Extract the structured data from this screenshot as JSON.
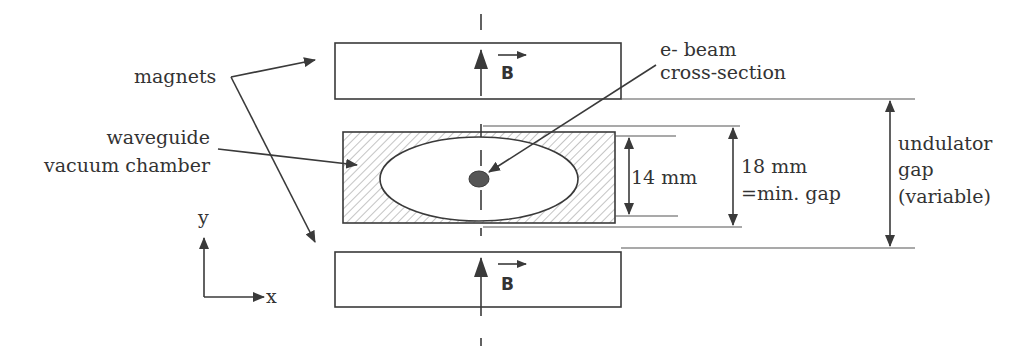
{
  "diagram": {
    "labels": {
      "magnets": "magnets",
      "waveguide_line1": "waveguide",
      "waveguide_line2": "vacuum chamber",
      "ebeam_line1": "e- beam",
      "ebeam_line2": "cross-section",
      "dim_inner": "14 mm",
      "dim_min_line1": "18 mm",
      "dim_min_line2": "=min. gap",
      "undulator_line1": "undulator",
      "undulator_line2": "gap",
      "undulator_line3": "(variable)",
      "field_top": "B",
      "field_bottom": "B",
      "axis_x": "x",
      "axis_y": "y"
    },
    "colors": {
      "stroke": "#3a3a3a",
      "hatch": "#777777",
      "beam": "#555555",
      "text": "#333333"
    }
  }
}
